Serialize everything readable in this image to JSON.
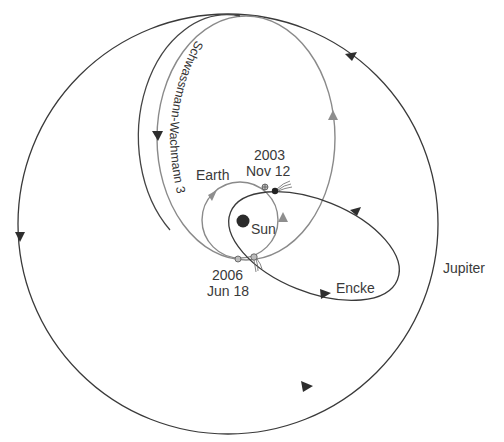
{
  "diagram": {
    "center_body": {
      "label": "Sun"
    },
    "orbits": [
      {
        "id": "jupiter",
        "label": "Jupiter",
        "direction": "counterclockwise",
        "color": "#3a3a3a"
      },
      {
        "id": "earth",
        "label": "Earth",
        "direction": "counterclockwise",
        "color": "#8a8a8a"
      },
      {
        "id": "schwassmann-wachmann-3",
        "label": "Schwassmann-Wachmann 3",
        "direction": "counterclockwise",
        "color": "#8a8a8a"
      },
      {
        "id": "encke",
        "label": "Encke",
        "direction": "counterclockwise",
        "color": "#3a3a3a"
      }
    ],
    "events": [
      {
        "year": "2003",
        "date": "Nov 12",
        "comet": "Encke",
        "note": "Earth and Encke near perihelion"
      },
      {
        "year": "2006",
        "date": "Jun 18",
        "comet": "Schwassmann-Wachmann 3",
        "note": "Earth and SW3 near perihelion"
      }
    ],
    "labels": {
      "jupiter": "Jupiter",
      "earth": "Earth",
      "sun": "Sun",
      "encke": "Encke",
      "sw3": "Schwassmann-Wachmann 3",
      "event1_year": "2003",
      "event1_date": "Nov 12",
      "event2_year": "2006",
      "event2_date": "Jun 18"
    },
    "colors": {
      "dark_orbit": "#3a3a3a",
      "light_orbit": "#8a8a8a",
      "background": "#ffffff"
    }
  }
}
